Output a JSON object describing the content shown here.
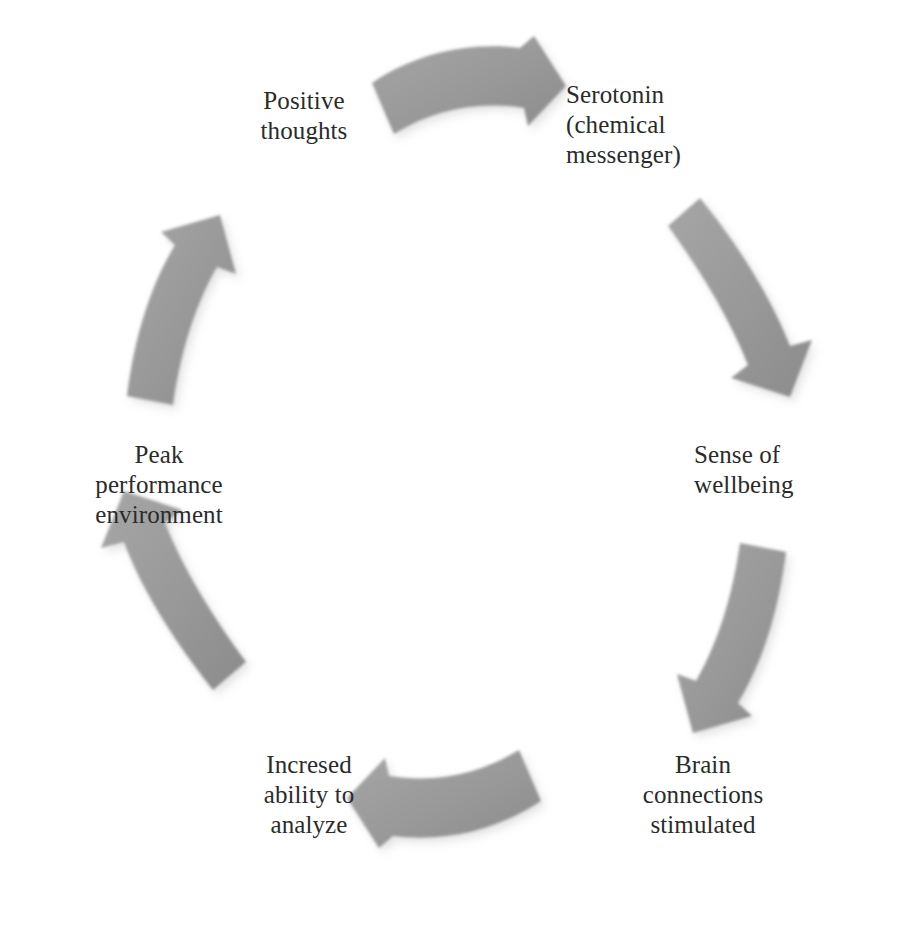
{
  "diagram": {
    "type": "cycle",
    "shape": "circular-clockwise",
    "step_count": 6,
    "arrow_color": "#9a9a9a",
    "text_color": "#2b2b2b",
    "background_color": "#ffffff",
    "nodes": [
      {
        "id": "positive-thoughts",
        "order": 1,
        "lines": [
          "Positive",
          "thoughts"
        ]
      },
      {
        "id": "serotonin",
        "order": 2,
        "lines": [
          "Serotonin",
          "(chemical",
          "messenger)"
        ]
      },
      {
        "id": "sense-of-wellbeing",
        "order": 3,
        "lines": [
          "Sense of",
          "wellbeing"
        ]
      },
      {
        "id": "brain-connections-stimulated",
        "order": 4,
        "lines": [
          "Brain",
          "connections",
          "stimulated"
        ]
      },
      {
        "id": "increased-ability-to-analyze",
        "order": 5,
        "lines": [
          "Incresed",
          "ability to",
          "analyze"
        ]
      },
      {
        "id": "peak-performance-environment",
        "order": 6,
        "lines": [
          "Peak",
          "performance",
          "environment"
        ]
      }
    ],
    "arrows": [
      {
        "id": "arrow-top",
        "from": "positive-thoughts",
        "to": "serotonin",
        "direction": "right"
      },
      {
        "id": "arrow-upper-right",
        "from": "serotonin",
        "to": "sense-of-wellbeing",
        "direction": "down-right"
      },
      {
        "id": "arrow-lower-right",
        "from": "sense-of-wellbeing",
        "to": "brain-connections-stimulated",
        "direction": "down-left"
      },
      {
        "id": "arrow-bottom",
        "from": "brain-connections-stimulated",
        "to": "increased-ability-to-analyze",
        "direction": "left"
      },
      {
        "id": "arrow-lower-left",
        "from": "increased-ability-to-analyze",
        "to": "peak-performance-environment",
        "direction": "up-left"
      },
      {
        "id": "arrow-upper-left",
        "from": "peak-performance-environment",
        "to": "positive-thoughts",
        "direction": "up-right"
      }
    ]
  }
}
